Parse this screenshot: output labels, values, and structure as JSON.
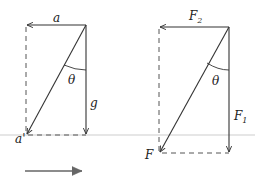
{
  "diagrams": [
    {
      "name": "acceleration-diagram",
      "vectors": {
        "horizontal": "a",
        "vertical": "g",
        "resultant": "a'"
      },
      "angle_label": "θ"
    },
    {
      "name": "force-diagram",
      "vectors": {
        "horizontal": "F",
        "horizontal_sub": "2",
        "vertical": "F",
        "vertical_sub": "1",
        "resultant": "F"
      },
      "angle_label": "θ"
    }
  ],
  "colors": {
    "line": "#333333",
    "dash": "#555555",
    "ground": "#dddddd",
    "bottom_arrow": "#666666"
  }
}
